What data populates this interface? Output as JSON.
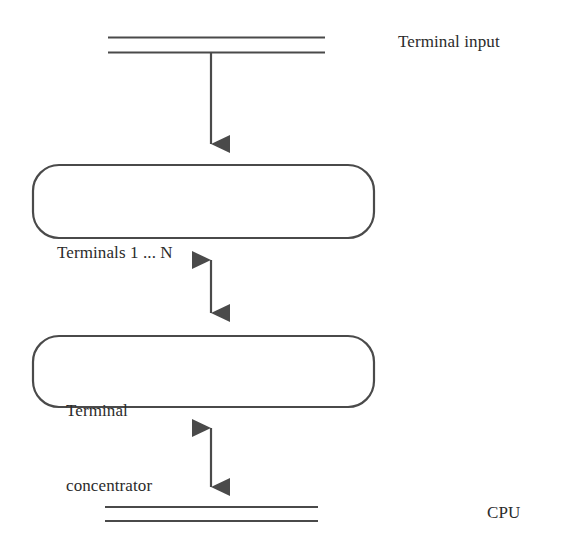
{
  "diagram": {
    "colors": {
      "line": "#4a4a4a",
      "text": "#2b2b2b",
      "background": "#ffffff",
      "box_fill": "#ffffff"
    },
    "labels": {
      "terminal_input": "Terminal input",
      "cpu": "CPU"
    },
    "boxes": [
      {
        "name": "terminals",
        "lines": [
          "Terminals 1 ... N"
        ]
      },
      {
        "name": "terminal-concentrator",
        "lines": [
          "Terminal",
          "concentrator"
        ]
      }
    ],
    "buses": [
      {
        "name": "terminal-input-bus",
        "label": "Terminal input"
      },
      {
        "name": "cpu-bus",
        "label": "CPU"
      }
    ],
    "connectors": [
      {
        "name": "input-bus-to-terminals",
        "direction": "down"
      },
      {
        "name": "terminals-to-concentrator",
        "direction": "both"
      },
      {
        "name": "concentrator-to-cpu-bus",
        "direction": "both"
      }
    ]
  }
}
